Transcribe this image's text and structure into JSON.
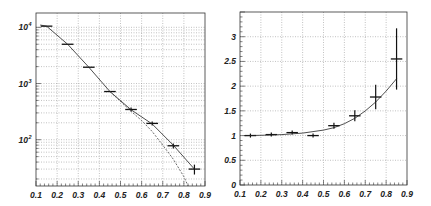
{
  "figure": {
    "background": "#ffffff",
    "frame_color": "#333333",
    "grid_color": "#999999",
    "line_color": "#222222"
  },
  "chart_data": [
    {
      "type": "line",
      "title": "",
      "xlabel": "",
      "ylabel": "",
      "yscale": "log",
      "xlim": [
        0.1,
        0.9
      ],
      "ylim": [
        15,
        18000
      ],
      "grid": true,
      "x_ticks": [
        "0.1",
        "0.2",
        "0.3",
        "0.4",
        "0.5",
        "0.6",
        "0.7",
        "0.8",
        "0.9"
      ],
      "y_ticks": [
        {
          "value": 10000,
          "label": "10",
          "exp": "4"
        },
        {
          "value": 1000,
          "label": "10",
          "exp": "3"
        },
        {
          "value": 100,
          "label": "10",
          "exp": "2"
        }
      ],
      "series": [
        {
          "name": "data",
          "style": "points-with-xerror",
          "x": [
            0.15,
            0.25,
            0.35,
            0.45,
            0.55,
            0.65,
            0.75,
            0.85
          ],
          "values": [
            10500,
            5000,
            1950,
            720,
            345,
            195,
            78,
            30
          ],
          "y_err": [
            0,
            0,
            0,
            0,
            10,
            15,
            8,
            6
          ]
        },
        {
          "name": "fit (solid)",
          "style": "solid",
          "x": [
            0.12,
            0.15,
            0.25,
            0.35,
            0.45,
            0.55,
            0.65,
            0.75,
            0.85
          ],
          "values": [
            11000,
            10500,
            5000,
            1950,
            720,
            340,
            190,
            80,
            30
          ]
        },
        {
          "name": "reference (dashed)",
          "style": "dashed",
          "x": [
            0.45,
            0.55,
            0.6,
            0.65,
            0.7,
            0.75,
            0.8,
            0.82
          ],
          "values": [
            720,
            320,
            220,
            140,
            80,
            45,
            22,
            15
          ]
        }
      ]
    },
    {
      "type": "line",
      "title": "",
      "xlabel": "",
      "ylabel": "",
      "yscale": "linear",
      "xlim": [
        0.1,
        0.9
      ],
      "ylim": [
        0,
        3.5
      ],
      "grid": true,
      "x_ticks": [
        "0.1",
        "0.2",
        "0.3",
        "0.4",
        "0.5",
        "0.6",
        "0.7",
        "0.8",
        "0.9"
      ],
      "y_ticks": [
        {
          "value": 0,
          "label": "0"
        },
        {
          "value": 0.5,
          "label": "0.5"
        },
        {
          "value": 1,
          "label": "1"
        },
        {
          "value": 1.5,
          "label": "1.5"
        },
        {
          "value": 2,
          "label": "2"
        },
        {
          "value": 2.5,
          "label": "2.5"
        },
        {
          "value": 3,
          "label": "3"
        }
      ],
      "series": [
        {
          "name": "ratio",
          "style": "points-with-xyerror",
          "x": [
            0.15,
            0.25,
            0.35,
            0.45,
            0.55,
            0.65,
            0.75,
            0.85
          ],
          "values": [
            1.0,
            1.02,
            1.06,
            1.0,
            1.2,
            1.4,
            1.78,
            2.55
          ],
          "y_err": [
            0.005,
            0.01,
            0.015,
            0.03,
            0.06,
            0.11,
            0.25,
            0.62
          ]
        },
        {
          "name": "fit",
          "style": "solid",
          "x": [
            0.12,
            0.2,
            0.3,
            0.4,
            0.5,
            0.55,
            0.6,
            0.65,
            0.7,
            0.75,
            0.8,
            0.85
          ],
          "values": [
            1.0,
            1.005,
            1.02,
            1.05,
            1.11,
            1.16,
            1.24,
            1.35,
            1.5,
            1.68,
            1.9,
            2.15
          ]
        }
      ]
    }
  ]
}
